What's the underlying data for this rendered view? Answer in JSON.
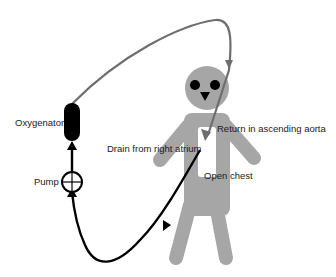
{
  "diagram": {
    "type": "cardiopulmonary-bypass-circuit",
    "labels": {
      "oxygenator": "Oxygenator",
      "pump": "Pump",
      "drain": "Drain from right atrium",
      "return": "Return in ascending aorta",
      "open_chest": "Open chest"
    },
    "colors": {
      "figure": "#a6a6a6",
      "return_line": "#6e6e6e",
      "drain_line": "#000000",
      "oxygenator": "#000000",
      "eyes": "#000000",
      "chest_opening": "#ffffff"
    },
    "flow": [
      {
        "from": "right atrium",
        "to": "pump",
        "line": "black"
      },
      {
        "from": "pump",
        "to": "oxygenator",
        "line": "black"
      },
      {
        "from": "oxygenator",
        "to": "ascending aorta",
        "line": "gray"
      }
    ]
  }
}
